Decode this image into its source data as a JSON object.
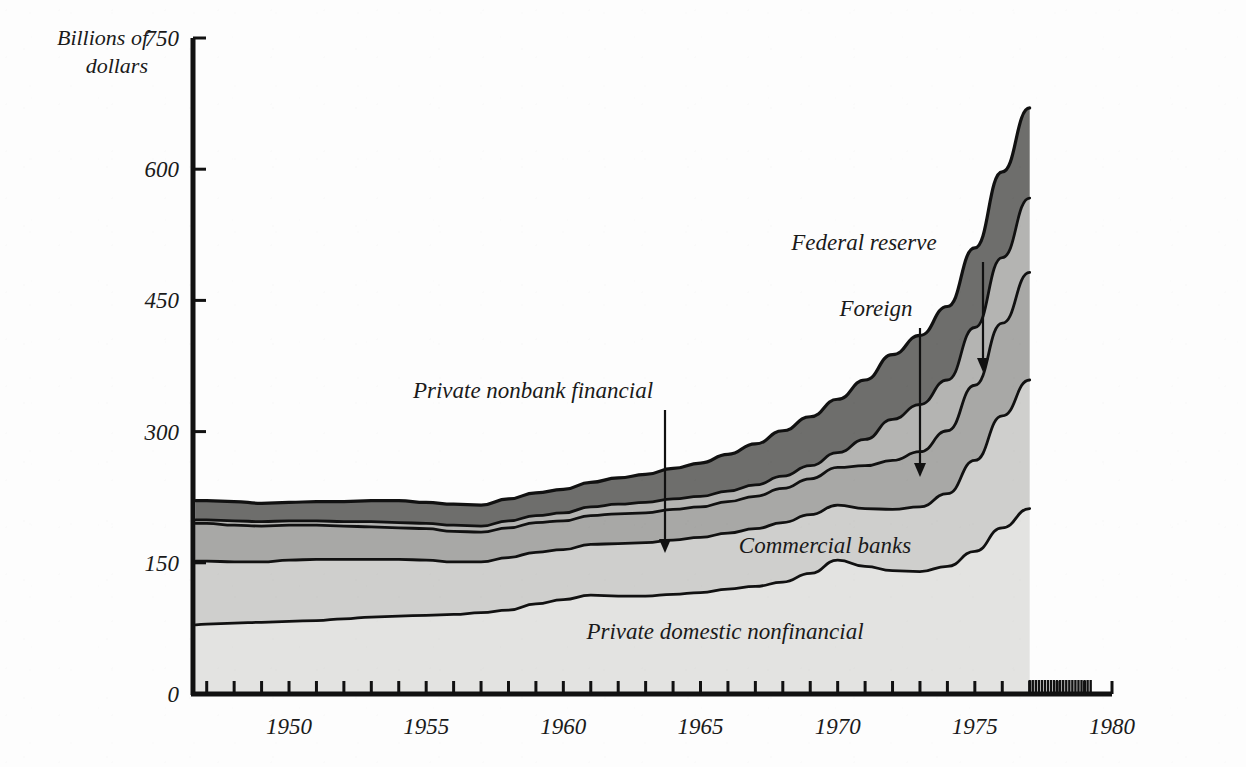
{
  "chart_data": {
    "type": "area",
    "title": "",
    "subtitle": "",
    "xlabel": "",
    "ylabel": "Billions of dollars",
    "ylabel_line1": "Billions of",
    "ylabel_line2": "dollars",
    "xlim": [
      1946.5,
      1980
    ],
    "ylim": [
      0,
      750
    ],
    "y_ticks": [
      0,
      150,
      300,
      450,
      600,
      750
    ],
    "y_tick_labels": [
      "0",
      "150",
      "300",
      "450",
      "600",
      "750"
    ],
    "x_ticks": [
      1947,
      1948,
      1949,
      1950,
      1951,
      1952,
      1953,
      1954,
      1955,
      1956,
      1957,
      1958,
      1959,
      1960,
      1961,
      1962,
      1963,
      1964,
      1965,
      1966,
      1967,
      1968,
      1969,
      1970,
      1971,
      1972,
      1973,
      1974,
      1975,
      1976,
      1977,
      1978,
      1979,
      1980
    ],
    "x_tick_labels": [
      "1950",
      "1955",
      "1960",
      "1965",
      "1970",
      "1975",
      "1980"
    ],
    "x_labeled_ticks": [
      1950,
      1955,
      1960,
      1965,
      1970,
      1975,
      1980
    ],
    "grid": false,
    "legend_position": "inline-annotations",
    "data_end_year": 1977.0,
    "dense_ticks_start": 1977.0,
    "dense_ticks_end": 1979.3,
    "stacking": "bottom-to-top",
    "x": [
      1946.6,
      1947,
      1948,
      1949,
      1950,
      1951,
      1952,
      1953,
      1954,
      1955,
      1956,
      1957,
      1958,
      1959,
      1960,
      1961,
      1962,
      1963,
      1964,
      1965,
      1966,
      1967,
      1968,
      1969,
      1970,
      1971,
      1972,
      1973,
      1974,
      1975,
      1976,
      1977
    ],
    "series": [
      {
        "name": "Private domestic nonfinancial",
        "color": "#e3e3e1",
        "values": [
          79,
          80,
          81,
          82,
          83,
          84,
          86,
          88,
          89,
          90,
          91,
          93,
          96,
          103,
          108,
          113,
          112,
          112,
          114,
          116,
          120,
          123,
          128,
          138,
          153,
          146,
          141,
          140,
          146,
          163,
          190,
          212
        ]
      },
      {
        "name": "Commercial banks",
        "color": "#cfcfcd",
        "values": [
          73,
          72,
          70,
          69,
          70,
          70,
          68,
          66,
          65,
          63,
          60,
          58,
          60,
          59,
          57,
          58,
          60,
          61,
          62,
          63,
          64,
          66,
          68,
          67,
          63,
          66,
          70,
          74,
          83,
          104,
          128,
          147
        ]
      },
      {
        "name": "Private nonbank financial",
        "color": "#a8a8a6",
        "values": [
          43,
          43,
          42,
          41,
          40,
          39,
          38,
          37,
          36,
          36,
          35,
          34,
          34,
          34,
          33,
          33,
          34,
          34,
          35,
          35,
          36,
          37,
          39,
          41,
          43,
          49,
          56,
          63,
          72,
          86,
          106,
          123
        ]
      },
      {
        "name": "Foreign",
        "color": "#b4b4b2",
        "values": [
          4,
          4,
          5,
          5,
          5,
          5,
          5,
          6,
          6,
          6,
          7,
          7,
          8,
          8,
          9,
          10,
          11,
          12,
          12,
          12,
          12,
          13,
          14,
          15,
          17,
          30,
          47,
          54,
          58,
          66,
          75,
          85
        ]
      },
      {
        "name": "Federal reserve",
        "color": "#6e6e6c",
        "values": [
          22,
          22,
          22,
          21,
          21,
          22,
          23,
          24,
          25,
          24,
          24,
          24,
          25,
          26,
          27,
          28,
          30,
          32,
          35,
          38,
          42,
          47,
          52,
          56,
          61,
          68,
          74,
          79,
          84,
          91,
          98,
          103
        ]
      }
    ],
    "totals_note": "Areas are stacked; topmost boundary reaches about 660 billion dollars in 1977.",
    "annotations": [
      {
        "text": "Federal reserve",
        "target_series": "Federal reserve",
        "has_arrow": true,
        "label_x": 864,
        "label_y": 250,
        "arrow_from_x": 983,
        "arrow_from_y": 262,
        "arrow_to_x": 983,
        "arrow_to_y": 372
      },
      {
        "text": "Foreign",
        "target_series": "Foreign",
        "has_arrow": true,
        "label_x": 876,
        "label_y": 316,
        "arrow_from_x": 920,
        "arrow_from_y": 328,
        "arrow_to_x": 920,
        "arrow_to_y": 477
      },
      {
        "text": "Private nonbank financial",
        "target_series": "Private nonbank financial",
        "has_arrow": true,
        "label_x": 533,
        "label_y": 398,
        "arrow_from_x": 665,
        "arrow_from_y": 410,
        "arrow_to_x": 665,
        "arrow_to_y": 553
      },
      {
        "text": "Commercial banks",
        "target_series": "Commercial banks",
        "has_arrow": false,
        "label_x": 825,
        "label_y": 553
      },
      {
        "text": "Private domestic nonfinancial",
        "target_series": "Private domestic nonfinancial",
        "has_arrow": false,
        "label_x": 725,
        "label_y": 639
      }
    ],
    "colors": {
      "axis": "#111111",
      "outline": "#111111",
      "background": "#fdfdfd",
      "band_federal_reserve": "#6e6e6c",
      "band_foreign": "#b4b4b2",
      "band_private_nonbank_financial": "#a8a8a6",
      "band_commercial_banks": "#cfcfcd",
      "band_private_domestic_nonfinancial": "#e3e3e1"
    }
  }
}
